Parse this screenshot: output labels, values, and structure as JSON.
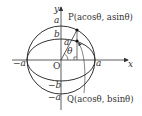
{
  "diagram": {
    "axes": {
      "x_label": "x",
      "y_label": "y",
      "origin_label": "O"
    },
    "tick_labels": {
      "pos_x": "a",
      "neg_x": "−a",
      "pos_y_a": "a",
      "pos_y_b": "b",
      "neg_y_b": "−b",
      "neg_y_a": "−a"
    },
    "segment_label": "a",
    "angle_label": "θ",
    "points": {
      "P": "P(acosθ, asinθ)",
      "Q": "Q(acosθ, bsinθ)"
    },
    "colors": {
      "stroke": "#333333",
      "background": "#ffffff"
    }
  }
}
